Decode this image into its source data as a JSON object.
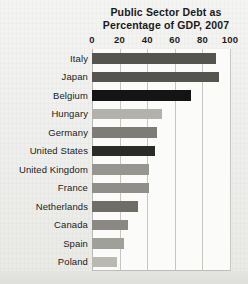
{
  "chart_data": {
    "type": "bar",
    "orientation": "horizontal",
    "title": "Public Sector Debt as Percentage of GDP, 2007",
    "title_lines": [
      "Public Sector Debt as",
      "Percentage of GDP, 2007"
    ],
    "xlabel": "",
    "ylabel": "",
    "xlim": [
      0,
      100
    ],
    "xticks": [
      0,
      20,
      40,
      60,
      80,
      100
    ],
    "xtick_labels": [
      "0",
      "20",
      "40",
      "60",
      "80",
      "100"
    ],
    "grid": true,
    "grid_axis": "x",
    "legend": "none",
    "categories": [
      "Italy",
      "Japan",
      "Belgium",
      "Hungary",
      "Germany",
      "United States",
      "United Kingdom",
      "France",
      "Netherlands",
      "Canada",
      "Spain",
      "Poland"
    ],
    "values": [
      90,
      92,
      72,
      51,
      47,
      46,
      41,
      41,
      33,
      26,
      23,
      18
    ],
    "bar_colors": [
      "#55544f",
      "#55544f",
      "#141414",
      "#b2b1ac",
      "#7d7c77",
      "#2b2b28",
      "#969590",
      "#8f8e89",
      "#6e6d68",
      "#898883",
      "#a0a09b",
      "#b9b8b3"
    ],
    "bars": [
      {
        "label": "Italy",
        "value": 90,
        "color": "#55544f"
      },
      {
        "label": "Japan",
        "value": 92,
        "color": "#55544f"
      },
      {
        "label": "Belgium",
        "value": 72,
        "color": "#141414"
      },
      {
        "label": "Hungary",
        "value": 51,
        "color": "#b2b1ac"
      },
      {
        "label": "Germany",
        "value": 47,
        "color": "#7d7c77"
      },
      {
        "label": "United States",
        "value": 46,
        "color": "#2b2b28"
      },
      {
        "label": "United Kingdom",
        "value": 41,
        "color": "#969590"
      },
      {
        "label": "France",
        "value": 41,
        "color": "#8f8e89"
      },
      {
        "label": "Netherlands",
        "value": 33,
        "color": "#6e6d68"
      },
      {
        "label": "Canada",
        "value": 26,
        "color": "#898883"
      },
      {
        "label": "Spain",
        "value": 23,
        "color": "#a0a09b"
      },
      {
        "label": "Poland",
        "value": 18,
        "color": "#b9b8b3"
      }
    ]
  },
  "colors": {
    "page_background": "#f2f2f0",
    "plot_background": "#fbfbfa",
    "gridline": "#c6c6c3",
    "axis": "#b9b9b6",
    "text": "#1a1a1a"
  }
}
